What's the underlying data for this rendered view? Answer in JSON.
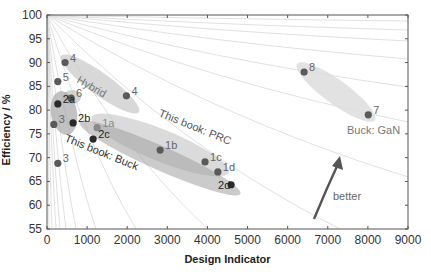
{
  "chart_data": {
    "type": "scatter",
    "title": "",
    "xlabel": "Design Indicator",
    "ylabel": "Efficiency / %",
    "xlim": [
      0,
      9000
    ],
    "ylim": [
      55,
      100
    ],
    "x_ticks": [
      0,
      1000,
      2000,
      3000,
      4000,
      5000,
      6000,
      7000,
      8000,
      9000
    ],
    "y_ticks": [
      55,
      60,
      65,
      70,
      75,
      80,
      85,
      90,
      95,
      100
    ],
    "grid": false,
    "background_curves": "iso-lines radiating from (0, 100%)",
    "points": [
      {
        "label": "4",
        "x": 450,
        "y": 90.0,
        "group": "Hybrid",
        "shade": "mid"
      },
      {
        "label": "5",
        "x": 270,
        "y": 86.0,
        "group": "Hybrid",
        "shade": "mid"
      },
      {
        "label": "6",
        "x": 600,
        "y": 82.5,
        "group": "Hybrid",
        "shade": "mid"
      },
      {
        "label": "4",
        "x": 1980,
        "y": 83.0,
        "group": "Hybrid",
        "shade": "mid"
      },
      {
        "label": "2a",
        "x": 270,
        "y": 81.3,
        "group": "This book: Buck",
        "shade": "dark"
      },
      {
        "label": "3",
        "x": 170,
        "y": 77.0,
        "group": "",
        "shade": "mid"
      },
      {
        "label": "2b",
        "x": 650,
        "y": 77.3,
        "group": "This book: Buck",
        "shade": "dark"
      },
      {
        "label": "1a",
        "x": 1250,
        "y": 76.3,
        "group": "This book: PRC",
        "shade": "light"
      },
      {
        "label": "2c",
        "x": 1150,
        "y": 73.9,
        "group": "This book: Buck",
        "shade": "dark"
      },
      {
        "label": "3",
        "x": 270,
        "y": 68.8,
        "group": "",
        "shade": "mid"
      },
      {
        "label": "1b",
        "x": 2820,
        "y": 71.6,
        "group": "This book: PRC",
        "shade": "mid"
      },
      {
        "label": "1c",
        "x": 3940,
        "y": 69.1,
        "group": "This book: PRC",
        "shade": "mid"
      },
      {
        "label": "1d",
        "x": 4260,
        "y": 67.0,
        "group": "This book: PRC",
        "shade": "mid"
      },
      {
        "label": "2d",
        "x": 4590,
        "y": 64.3,
        "group": "This book: Buck",
        "shade": "dark"
      },
      {
        "label": "8",
        "x": 6410,
        "y": 88.0,
        "group": "Buck: GaN",
        "shade": "mid"
      },
      {
        "label": "7",
        "x": 8010,
        "y": 79.0,
        "group": "Buck: GaN",
        "shade": "mid"
      }
    ],
    "annotations": [
      {
        "text": "Hybrid",
        "x": 900,
        "y": 83.5,
        "rotation": 28
      },
      {
        "text": "This book: PRC",
        "x": 3700,
        "y": 74.5,
        "rotation": 22
      },
      {
        "text": "This book: Buck",
        "x": 1500,
        "y": 71.0,
        "rotation": 22
      },
      {
        "text": "Buck: GaN",
        "x": 7500,
        "y": 76.5,
        "rotation": 0
      },
      {
        "text": "better",
        "x": 7700,
        "y": 63.5,
        "rotation": 0,
        "arrow": true
      }
    ]
  },
  "labels": {
    "xlabel": "Design Indicator",
    "ylabel": "Efficiency / %",
    "hybrid": "Hybrid",
    "prc": "This book: PRC",
    "buck": "This book: Buck",
    "gan": "Buck: GaN",
    "better": "better"
  },
  "colors": {
    "axis": "#555555",
    "iso_line": "#d8d8d8",
    "point_dark": "#2a2a2a",
    "point_mid": "#5a5a5a",
    "point_light": "#8a8a8a",
    "label_mid": "#666666",
    "label_light": "#888888",
    "arrow": "#555555"
  }
}
